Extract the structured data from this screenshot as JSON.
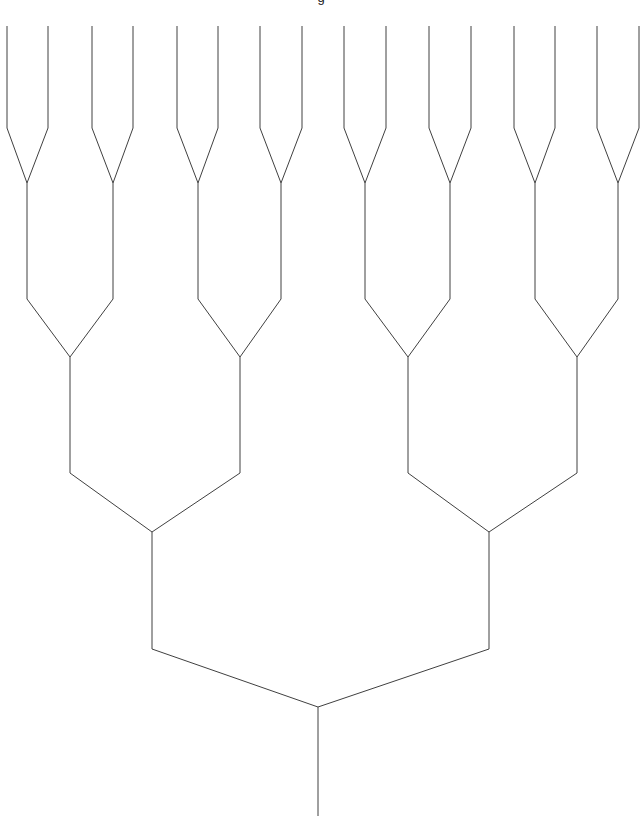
{
  "figure": {
    "kind": "dendrogram",
    "width": 642,
    "height": 824,
    "background_color": "#ffffff",
    "line_color": "#404040",
    "line_width": 1,
    "clipped_title": "g",
    "orientation": "root-at-bottom-leaves-at-top"
  },
  "chart_data": {
    "type": "line",
    "title": "",
    "xlabel": "",
    "ylabel": "",
    "subtitle": "",
    "grid": false,
    "legend": "none",
    "leaf_count": 16,
    "merge_levels": 4,
    "leaf_top_y": 26,
    "root_stem_bottom_y": 816,
    "leaf_x": [
      7,
      48,
      92,
      133,
      177,
      218,
      260,
      302,
      344,
      386,
      429,
      471,
      514,
      555,
      597,
      639
    ],
    "levels": [
      {
        "level": 1,
        "bend_y": 128,
        "merge_y": 183,
        "node_x": [
          27,
          113,
          198,
          281,
          365,
          450,
          535,
          618
        ]
      },
      {
        "level": 2,
        "bend_y": 299,
        "merge_y": 357,
        "node_x": [
          70,
          240,
          408,
          577
        ]
      },
      {
        "level": 3,
        "bend_y": 473,
        "merge_y": 532,
        "node_x": [
          152,
          489
        ]
      },
      {
        "level": 4,
        "bend_y": 649,
        "merge_y": 707,
        "node_x": [
          318
        ]
      }
    ],
    "axis_ranges": {
      "x": [
        0,
        642
      ],
      "y": [
        0,
        824
      ]
    }
  }
}
